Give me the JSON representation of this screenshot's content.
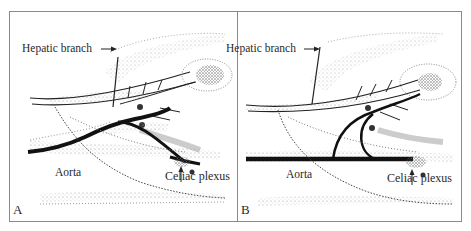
{
  "figure": {
    "panels": [
      {
        "letter": "A",
        "labels": {
          "hepatic": "Hepatic branch",
          "aorta": "Aorta",
          "celiac": "Celiac plexus"
        }
      },
      {
        "letter": "B",
        "labels": {
          "hepatic": "Hepatic branch",
          "aorta": "Aorta",
          "celiac": "Celiac plexus"
        }
      }
    ],
    "colors": {
      "ink": "#1a1a1a",
      "stipple": "#9a9a9a",
      "border": "#8a8a8a",
      "background": "#ffffff"
    }
  }
}
